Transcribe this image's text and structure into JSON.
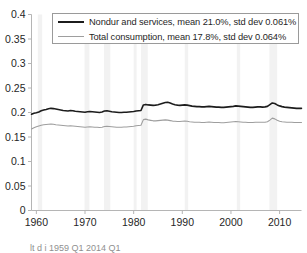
{
  "chart_data": {
    "type": "line",
    "title": "",
    "xlabel": "",
    "ylabel": "",
    "xlim": [
      1959.0,
      2014.5
    ],
    "ylim": [
      0,
      0.4
    ],
    "grid": false,
    "legend_position": "top-center",
    "xticks": [
      1960,
      1970,
      1980,
      1990,
      2000,
      2010
    ],
    "xtick_labels": [
      "1960",
      "1970",
      "1980",
      "1990",
      "2000",
      "2010"
    ],
    "yticks": [
      0,
      0.05,
      0.1,
      0.15,
      0.2,
      0.25,
      0.3,
      0.35,
      0.4
    ],
    "ytick_labels": [
      "0",
      "0.05",
      "0.1",
      "0.15",
      "0.2",
      "0.25",
      "0.3",
      "0.35",
      "0.4"
    ],
    "recession_bands": [
      [
        1960.3,
        1961.2
      ],
      [
        1969.9,
        1970.9
      ],
      [
        1973.9,
        1975.2
      ],
      [
        1980.0,
        1980.6
      ],
      [
        1981.5,
        1982.9
      ],
      [
        1990.5,
        1991.2
      ],
      [
        2001.2,
        2001.9
      ],
      [
        2007.9,
        2009.5
      ]
    ],
    "series": [
      {
        "name": "Nondur and services, mean 21.0%, std dev 0.061%",
        "short_name": "Nondur and services",
        "mean_pct": "21.0%",
        "std_dev_pct": "0.061%",
        "color": "#1c1c1c",
        "line_width": 1.6,
        "x": [
          1959.0,
          1959.5,
          1960.0,
          1960.5,
          1961.0,
          1961.5,
          1962.0,
          1962.5,
          1963.0,
          1963.5,
          1964.0,
          1964.5,
          1965.0,
          1965.5,
          1966.0,
          1966.5,
          1967.0,
          1967.5,
          1968.0,
          1968.5,
          1969.0,
          1969.5,
          1970.0,
          1970.5,
          1971.0,
          1971.5,
          1972.0,
          1972.5,
          1973.0,
          1973.5,
          1974.0,
          1974.5,
          1975.0,
          1975.5,
          1976.0,
          1976.5,
          1977.0,
          1977.5,
          1978.0,
          1978.5,
          1979.0,
          1979.5,
          1980.0,
          1980.5,
          1981.0,
          1981.5,
          1982.0,
          1982.5,
          1983.0,
          1983.5,
          1984.0,
          1984.5,
          1985.0,
          1985.5,
          1986.0,
          1986.5,
          1987.0,
          1987.5,
          1988.0,
          1988.5,
          1989.0,
          1989.5,
          1990.0,
          1990.5,
          1991.0,
          1991.5,
          1992.0,
          1992.5,
          1993.0,
          1993.5,
          1994.0,
          1994.5,
          1995.0,
          1995.5,
          1996.0,
          1996.5,
          1997.0,
          1997.5,
          1998.0,
          1998.5,
          1999.0,
          1999.5,
          2000.0,
          2000.5,
          2001.0,
          2001.5,
          2002.0,
          2002.5,
          2003.0,
          2003.5,
          2004.0,
          2004.5,
          2005.0,
          2005.5,
          2006.0,
          2006.5,
          2007.0,
          2007.5,
          2008.0,
          2008.5,
          2009.0,
          2009.5,
          2010.0,
          2010.5,
          2011.0,
          2011.5,
          2012.0,
          2012.5,
          2013.0,
          2013.5,
          2014.0,
          2014.5
        ],
        "y": [
          0.1965,
          0.1985,
          0.1995,
          0.201,
          0.2035,
          0.205,
          0.206,
          0.2075,
          0.2085,
          0.208,
          0.207,
          0.206,
          0.205,
          0.204,
          0.2035,
          0.203,
          0.204,
          0.2035,
          0.2025,
          0.202,
          0.2015,
          0.201,
          0.2005,
          0.2015,
          0.202,
          0.2015,
          0.201,
          0.2005,
          0.2,
          0.201,
          0.203,
          0.2035,
          0.2025,
          0.2015,
          0.201,
          0.2005,
          0.2,
          0.2,
          0.2005,
          0.2005,
          0.201,
          0.2015,
          0.202,
          0.203,
          0.2035,
          0.204,
          0.2155,
          0.2165,
          0.2155,
          0.215,
          0.2145,
          0.215,
          0.216,
          0.2175,
          0.219,
          0.2205,
          0.221,
          0.2195,
          0.2175,
          0.216,
          0.215,
          0.2145,
          0.215,
          0.2155,
          0.215,
          0.214,
          0.213,
          0.2125,
          0.212,
          0.212,
          0.2115,
          0.2115,
          0.212,
          0.2125,
          0.212,
          0.2115,
          0.211,
          0.211,
          0.2105,
          0.2105,
          0.211,
          0.2115,
          0.212,
          0.2125,
          0.2135,
          0.213,
          0.2125,
          0.212,
          0.2115,
          0.211,
          0.2105,
          0.2105,
          0.211,
          0.2115,
          0.2115,
          0.211,
          0.2115,
          0.2125,
          0.216,
          0.2195,
          0.2185,
          0.2155,
          0.2135,
          0.212,
          0.211,
          0.2105,
          0.21,
          0.2095,
          0.209,
          0.2085,
          0.2085,
          0.2085
        ]
      },
      {
        "name": "Total consumption, mean 17.8%, std dev 0.064%",
        "short_name": "Total consumption",
        "mean_pct": "17.8%",
        "std_dev_pct": "0.064%",
        "color": "#9e9e9e",
        "line_width": 1.1,
        "x": [
          1959.0,
          1959.5,
          1960.0,
          1960.5,
          1961.0,
          1961.5,
          1962.0,
          1962.5,
          1963.0,
          1963.5,
          1964.0,
          1964.5,
          1965.0,
          1965.5,
          1966.0,
          1966.5,
          1967.0,
          1967.5,
          1968.0,
          1968.5,
          1969.0,
          1969.5,
          1970.0,
          1970.5,
          1971.0,
          1971.5,
          1972.0,
          1972.5,
          1973.0,
          1973.5,
          1974.0,
          1974.5,
          1975.0,
          1975.5,
          1976.0,
          1976.5,
          1977.0,
          1977.5,
          1978.0,
          1978.5,
          1979.0,
          1979.5,
          1980.0,
          1980.5,
          1981.0,
          1981.5,
          1982.0,
          1982.5,
          1983.0,
          1983.5,
          1984.0,
          1984.5,
          1985.0,
          1985.5,
          1986.0,
          1986.5,
          1987.0,
          1987.5,
          1988.0,
          1988.5,
          1989.0,
          1989.5,
          1990.0,
          1990.5,
          1991.0,
          1991.5,
          1992.0,
          1992.5,
          1993.0,
          1993.5,
          1994.0,
          1994.5,
          1995.0,
          1995.5,
          1996.0,
          1996.5,
          1997.0,
          1997.5,
          1998.0,
          1998.5,
          1999.0,
          1999.5,
          2000.0,
          2000.5,
          2001.0,
          2001.5,
          2002.0,
          2002.5,
          2003.0,
          2003.5,
          2004.0,
          2004.5,
          2005.0,
          2005.5,
          2006.0,
          2006.5,
          2007.0,
          2007.5,
          2008.0,
          2008.5,
          2009.0,
          2009.5,
          2010.0,
          2010.5,
          2011.0,
          2011.5,
          2012.0,
          2012.5,
          2013.0,
          2013.5,
          2014.0,
          2014.5
        ],
        "y": [
          0.1665,
          0.169,
          0.171,
          0.1725,
          0.174,
          0.175,
          0.1755,
          0.176,
          0.1765,
          0.176,
          0.175,
          0.1745,
          0.174,
          0.1735,
          0.173,
          0.1725,
          0.173,
          0.1725,
          0.172,
          0.1715,
          0.171,
          0.1705,
          0.17,
          0.1705,
          0.171,
          0.1705,
          0.17,
          0.17,
          0.1695,
          0.17,
          0.1715,
          0.172,
          0.1715,
          0.171,
          0.1705,
          0.17,
          0.17,
          0.17,
          0.1705,
          0.1705,
          0.171,
          0.1715,
          0.172,
          0.173,
          0.1735,
          0.174,
          0.1855,
          0.1865,
          0.185,
          0.184,
          0.183,
          0.183,
          0.1835,
          0.184,
          0.1845,
          0.185,
          0.1845,
          0.1835,
          0.1825,
          0.182,
          0.1815,
          0.1815,
          0.182,
          0.1825,
          0.182,
          0.181,
          0.1805,
          0.18,
          0.18,
          0.18,
          0.1795,
          0.1795,
          0.18,
          0.1805,
          0.18,
          0.1795,
          0.1795,
          0.1795,
          0.179,
          0.179,
          0.1795,
          0.18,
          0.1805,
          0.181,
          0.1815,
          0.181,
          0.1805,
          0.18,
          0.18,
          0.1795,
          0.1795,
          0.1795,
          0.18,
          0.18,
          0.18,
          0.18,
          0.18,
          0.181,
          0.1845,
          0.1885,
          0.187,
          0.184,
          0.182,
          0.181,
          0.1805,
          0.18,
          0.18,
          0.18,
          0.1795,
          0.1795,
          0.1795,
          0.1795
        ]
      }
    ]
  },
  "axis": {
    "spine_color": "#b5b5b5",
    "tick_color": "#b5b5b5",
    "label_color": "#262626",
    "recession_band_color": "#f2f2f2"
  },
  "caption": {
    "text": "lt d i 1959 Q1 2014 Q1"
  }
}
